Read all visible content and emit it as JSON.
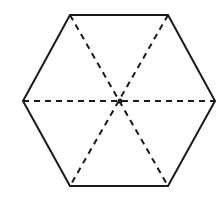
{
  "diagram": {
    "shape": "regular hexagon",
    "stroke_color": "#1a1a1a",
    "vertices": [
      [
        70,
        15
      ],
      [
        168,
        15
      ],
      [
        215,
        101
      ],
      [
        168,
        186
      ],
      [
        70,
        186
      ],
      [
        23,
        101
      ]
    ],
    "center": [
      120,
      101
    ],
    "diagonals": [
      {
        "from": [
          70,
          15
        ],
        "to": [
          168,
          186
        ],
        "style": "dashed"
      },
      {
        "from": [
          168,
          15
        ],
        "to": [
          70,
          186
        ],
        "style": "dashed"
      },
      {
        "from": [
          23,
          101
        ],
        "to": [
          215,
          101
        ],
        "style": "dashed"
      }
    ]
  }
}
